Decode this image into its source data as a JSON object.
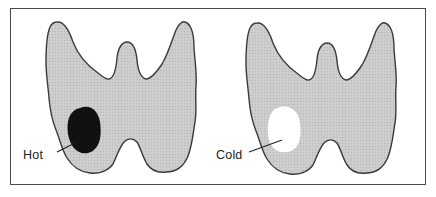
{
  "figure": {
    "colors": {
      "frame": "#4a4a4a",
      "gland_fill": "#c9c9c9",
      "gland_outline": "#3a3a3a",
      "hot_nodule": "#111111",
      "cold_nodule": "#ffffff",
      "background": "#ffffff"
    },
    "panels": [
      {
        "id": "hot",
        "label": "Hot",
        "nodule": "dark (hot) nodule in lower left lobe"
      },
      {
        "id": "cold",
        "label": "Cold",
        "nodule": "white (cold) nodule in lower left lobe"
      }
    ],
    "caption": ""
  }
}
